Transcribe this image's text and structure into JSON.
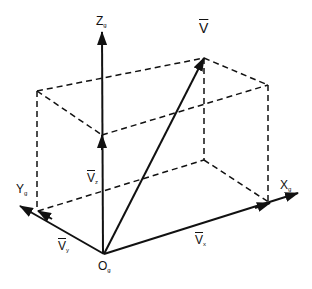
{
  "diagram": {
    "type": "3D vector decomposition",
    "labels": {
      "origin": {
        "main": "O",
        "sub": "g"
      },
      "x_axis": {
        "main": "X",
        "sub": "g"
      },
      "y_axis": {
        "main": "Y",
        "sub": "g"
      },
      "z_axis": {
        "main": "Z",
        "sub": "g"
      },
      "vector": {
        "main": "V"
      },
      "vx": {
        "main": "V",
        "sub": "x"
      },
      "vy": {
        "main": "V",
        "sub": "y"
      },
      "vz": {
        "main": "V",
        "sub": "z"
      }
    },
    "colors": {
      "line": "#111111",
      "background": "#ffffff"
    }
  }
}
